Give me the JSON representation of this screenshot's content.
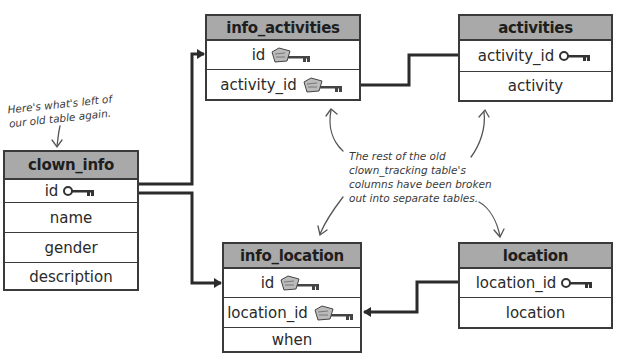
{
  "annotations": {
    "left_note": [
      "Here's what's left of",
      "our old table again."
    ],
    "center_note": [
      "The rest of the old",
      "clown_tracking table's",
      "columns have been broken",
      "out into separate tables."
    ]
  },
  "tables": {
    "clown_info": {
      "title": "clown_info",
      "rows": [
        {
          "label": "id",
          "key": "primary-key"
        },
        {
          "label": "name"
        },
        {
          "label": "gender"
        },
        {
          "label": "description"
        }
      ]
    },
    "info_activities": {
      "title": "info_activities",
      "rows": [
        {
          "label": "id",
          "key": "foreign-key"
        },
        {
          "label": "activity_id",
          "key": "foreign-key"
        }
      ]
    },
    "activities": {
      "title": "activities",
      "rows": [
        {
          "label": "activity_id",
          "key": "primary-key"
        },
        {
          "label": "activity"
        }
      ]
    },
    "info_location": {
      "title": "info_location",
      "rows": [
        {
          "label": "id",
          "key": "foreign-key"
        },
        {
          "label": "location_id",
          "key": "foreign-key"
        },
        {
          "label": "when"
        }
      ]
    },
    "location": {
      "title": "location",
      "rows": [
        {
          "label": "location_id",
          "key": "primary-key"
        },
        {
          "label": "location"
        }
      ]
    }
  },
  "relationships": [
    {
      "from": "clown_info.id",
      "to": "info_activities.id"
    },
    {
      "from": "clown_info.id",
      "to": "info_location.id"
    },
    {
      "from": "activities.activity_id",
      "to": "info_activities.activity_id"
    },
    {
      "from": "location.location_id",
      "to": "info_location.location_id"
    }
  ],
  "colors": {
    "header_fill": "#a9a9a9",
    "border": "#3a3a3a",
    "line": "#2b2b2b",
    "background": "#ffffff"
  }
}
